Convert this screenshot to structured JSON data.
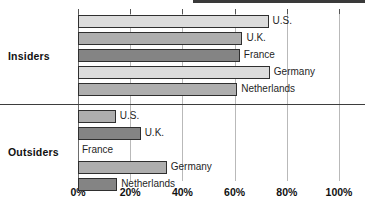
{
  "chart_data": {
    "type": "bar",
    "orientation": "horizontal",
    "title": "",
    "xlabel": "",
    "ylabel": "",
    "xlim": [
      0,
      100
    ],
    "xticks": [
      0,
      20,
      40,
      60,
      80,
      100
    ],
    "xtick_labels": [
      "0%",
      "20%",
      "40%",
      "60%",
      "80%",
      "100%"
    ],
    "grid": true,
    "legend": "none",
    "value_suffix": "%",
    "groups": [
      {
        "name": "Insiders",
        "bars": [
          {
            "label": "U.S.",
            "value": 73,
            "shade": "shade-light"
          },
          {
            "label": "U.K.",
            "value": 63,
            "shade": "shade-mid"
          },
          {
            "label": "France",
            "value": 62,
            "shade": "shade-dark"
          },
          {
            "label": "Germany",
            "value": 73.5,
            "shade": "shade-light"
          },
          {
            "label": "Netherlands",
            "value": 61,
            "shade": "shade-mid"
          }
        ]
      },
      {
        "name": "Outsiders",
        "bars": [
          {
            "label": "U.S.",
            "value": 14.5,
            "shade": "shade-mid"
          },
          {
            "label": "U.K.",
            "value": 24,
            "shade": "shade-dark"
          },
          {
            "label": "France",
            "value": 0,
            "shade": "shade-zero"
          },
          {
            "label": "Germany",
            "value": 34,
            "shade": "shade-mid"
          },
          {
            "label": "Netherlands",
            "value": 15,
            "shade": "shade-dark"
          }
        ]
      }
    ]
  }
}
